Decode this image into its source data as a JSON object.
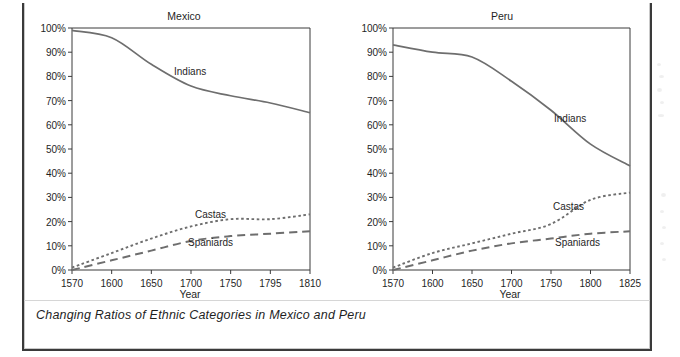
{
  "figure": {
    "caption": "Changing Ratios of Ethnic Categories in Mexico and Peru"
  },
  "chart_data": [
    {
      "type": "line",
      "title": "Mexico",
      "xlabel": "Year",
      "ylabel": "",
      "xlim": [
        1570,
        1810
      ],
      "ylim": [
        0,
        100
      ],
      "grid": false,
      "legend_position": "inline-annotation",
      "xticks": [
        "1570",
        "1600",
        "1650",
        "1700",
        "1750",
        "1795",
        "1810"
      ],
      "xtick_values": [
        1570,
        1600,
        1650,
        1700,
        1750,
        1795,
        1810
      ],
      "yticks": [
        "0%",
        "10%",
        "20%",
        "30%",
        "40%",
        "50%",
        "60%",
        "70%",
        "80%",
        "90%",
        "100%"
      ],
      "ytick_values": [
        0,
        10,
        20,
        30,
        40,
        50,
        60,
        70,
        80,
        90,
        100
      ],
      "x": [
        1570,
        1600,
        1650,
        1700,
        1750,
        1795,
        1810
      ],
      "series": [
        {
          "name": "Indians",
          "style": "solid",
          "values": [
            99,
            96,
            85,
            76,
            72,
            69,
            65
          ]
        },
        {
          "name": "Castas",
          "style": "dotted",
          "values": [
            1,
            7,
            13,
            18,
            21,
            21,
            23
          ]
        },
        {
          "name": "Spaniards",
          "style": "dashed",
          "values": [
            0,
            4,
            8,
            12,
            14,
            15,
            16
          ]
        }
      ]
    },
    {
      "type": "line",
      "title": "Peru",
      "xlabel": "Year",
      "ylabel": "",
      "xlim": [
        1570,
        1825
      ],
      "ylim": [
        0,
        100
      ],
      "grid": false,
      "legend_position": "inline-annotation",
      "xticks": [
        "1570",
        "1600",
        "1650",
        "1700",
        "1750",
        "1800",
        "1825"
      ],
      "xtick_values": [
        1570,
        1600,
        1650,
        1700,
        1750,
        1800,
        1825
      ],
      "yticks": [
        "0%",
        "10%",
        "20%",
        "30%",
        "40%",
        "50%",
        "60%",
        "70%",
        "80%",
        "90%",
        "100%"
      ],
      "ytick_values": [
        0,
        10,
        20,
        30,
        40,
        50,
        60,
        70,
        80,
        90,
        100
      ],
      "x": [
        1570,
        1600,
        1650,
        1700,
        1750,
        1800,
        1825
      ],
      "series": [
        {
          "name": "Indians",
          "style": "solid",
          "values": [
            93,
            90,
            88,
            78,
            66,
            52,
            43
          ]
        },
        {
          "name": "Castas",
          "style": "dotted",
          "values": [
            1,
            7,
            11,
            15,
            19,
            29,
            32
          ]
        },
        {
          "name": "Spaniards",
          "style": "dashed",
          "values": [
            0,
            4,
            8,
            11,
            13,
            15,
            16
          ]
        }
      ]
    }
  ],
  "colors": {
    "line": "#6e6e6e",
    "axis": "#3a3a3a",
    "text": "#1f1f1f",
    "frame": "#3a3a3a",
    "background": "#ffffff"
  }
}
